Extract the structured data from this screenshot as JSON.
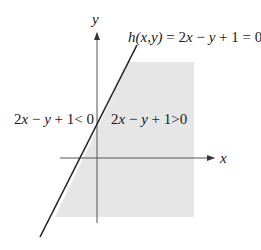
{
  "diagram": {
    "type": "half-plane illustration",
    "axes": {
      "x_label": "x",
      "y_label": "y"
    },
    "boundary_label": {
      "func": "h",
      "args": "(x,y)",
      "equals": " = 2",
      "x": "x",
      "minus": " − ",
      "y": "y",
      "rest": " + 1 = 0"
    },
    "region_negative": {
      "prefix": "2",
      "x": "x",
      "minus": " − ",
      "y": "y",
      "rest": " + 1< 0"
    },
    "region_positive": {
      "prefix": "2",
      "x": "x",
      "minus": " − ",
      "y": "y",
      "rest": " + 1>0"
    },
    "colors": {
      "shade": "#e6e6e6",
      "line": "#222222",
      "axis": "#555555"
    }
  }
}
